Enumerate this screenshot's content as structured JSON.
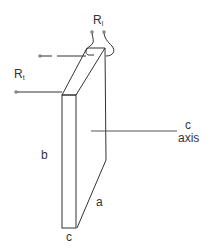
{
  "diagram": {
    "type": "crystal-sample-schematic",
    "colors": {
      "line": "#333333",
      "background": "#ffffff"
    },
    "labels": {
      "r_l_main": "R",
      "r_l_sub": "l",
      "r_t_main": "R",
      "r_t_sub": "t",
      "dim_b": "b",
      "dim_a": "a",
      "dim_c": "c",
      "axis_c": "c",
      "axis_word": "axis"
    }
  }
}
